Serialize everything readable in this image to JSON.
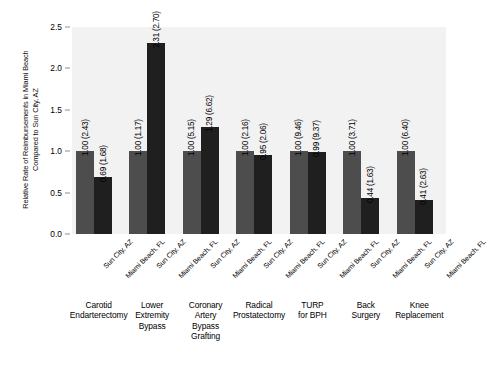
{
  "chart_data": {
    "type": "bar",
    "title": "",
    "xlabel": "",
    "ylabel": "Relative Rate of Reimbursements in Miami Beach\nCompared to Sun City, AZ",
    "ylim": [
      0.0,
      2.5
    ],
    "yticks": [
      "0.0",
      "0.5",
      "1.0",
      "1.5",
      "2.0",
      "2.5"
    ],
    "ytick_values": [
      0.0,
      0.5,
      1.0,
      1.5,
      2.0,
      2.5
    ],
    "grid": false,
    "legend": "none",
    "series": [
      {
        "name": "Sun City, AZ",
        "color": "#4d4d4d",
        "values": [
          1.0,
          1.0,
          1.0,
          1.0,
          1.0,
          1.0,
          1.0
        ]
      },
      {
        "name": "Miami Beach, FL",
        "color": "#1f1f1f",
        "values": [
          0.69,
          2.31,
          1.29,
          0.95,
          0.99,
          0.44,
          0.41
        ]
      }
    ],
    "categories": [
      "Carotid\nEndarterectomy",
      "Lower\nExtremity\nBypass",
      "Coronary\nArtery\nBypass\nGrafting",
      "Radical\nProstatectomy",
      "TURP\nfor BPH",
      "Back\nSurgery",
      "Knee\nReplacement"
    ],
    "group_sublabels": [
      "Sun City, AZ",
      "Miami Beach, FL"
    ],
    "data_labels": [
      {
        "category": "Carotid Endarterectomy",
        "az": "1.00 (2.43)",
        "fl": "0.69 (1.68)"
      },
      {
        "category": "Lower Extremity Bypass",
        "az": "1.00 (1.17)",
        "fl": "2.31 (2.70)"
      },
      {
        "category": "Coronary Artery Bypass Grafting",
        "az": "1.00 (5.15)",
        "fl": "1.29 (6.62)"
      },
      {
        "category": "Radical Prostatectomy",
        "az": "1.00 (2.16)",
        "fl": "0.95 (2.06)"
      },
      {
        "category": "TURP for BPH",
        "az": "1.00 (9.46)",
        "fl": "0.99 (9.37)"
      },
      {
        "category": "Back Surgery",
        "az": "1.00 (3.71)",
        "fl": "0.44 (1.63)"
      },
      {
        "category": "Knee Replacement",
        "az": "1.00 (6.40)",
        "fl": "0.41 (2.63)"
      }
    ],
    "colors": {
      "plot_background": "#f2f2f2",
      "page_background": "#ffffff",
      "bar_az": "#4d4d4d",
      "bar_fl": "#1f1f1f",
      "tick": "#8d8d8d",
      "text": "#000000"
    }
  }
}
